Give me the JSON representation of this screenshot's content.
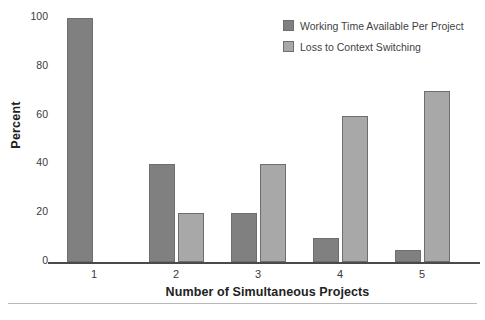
{
  "chart_data": {
    "type": "bar",
    "title": "",
    "subtitle": "",
    "xlabel": "Number of Simultaneous Projects",
    "ylabel": "Percent",
    "categories": [
      "1",
      "2",
      "3",
      "4",
      "5"
    ],
    "series": [
      {
        "name": "Working Time Available Per Project",
        "color": "#808080",
        "values": [
          100,
          40,
          20,
          10,
          5
        ]
      },
      {
        "name": "Loss to Context Switching",
        "color": "#a8a8a8",
        "values": [
          0,
          20,
          40,
          60,
          70
        ]
      }
    ],
    "ylim": [
      0,
      100
    ],
    "yticks": [
      0,
      20,
      40,
      60,
      80,
      100
    ],
    "ytick_labels": [
      "0",
      "20",
      "40",
      "60",
      "80",
      "100"
    ],
    "grid": false,
    "legend_position": "top-right"
  },
  "colors": {
    "series_dark": "#808080",
    "series_light": "#a8a8a8",
    "bar_edge": "#6e6e6e",
    "axis": "#4a4a4a",
    "text": "#3a3a3a",
    "title_text": "#222222",
    "rule": "#b9b9b9",
    "background": "#ffffff"
  }
}
